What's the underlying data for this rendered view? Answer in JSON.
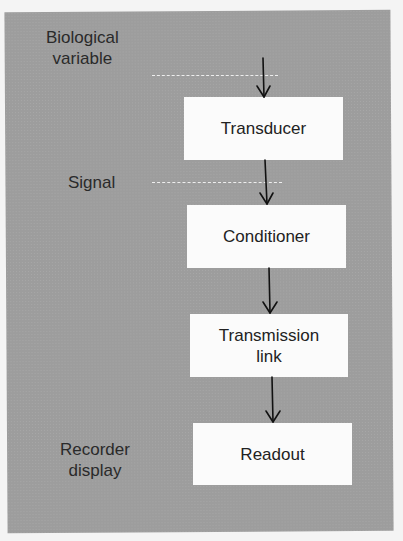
{
  "diagram": {
    "type": "block flow diagram",
    "side_labels": [
      {
        "id": "biological-variable",
        "line1": "Biological",
        "line2": "variable"
      },
      {
        "id": "signal",
        "line1": "Signal"
      },
      {
        "id": "recorder-display",
        "line1": "Recorder",
        "line2": "display"
      }
    ],
    "blocks": [
      {
        "id": "transducer",
        "line1": "Transducer"
      },
      {
        "id": "conditioner",
        "line1": "Conditioner"
      },
      {
        "id": "transmission-link",
        "line1": "Transmission",
        "line2": "link"
      },
      {
        "id": "readout",
        "line1": "Readout"
      }
    ],
    "flow": [
      "Biological variable",
      "Transducer",
      "Conditioner",
      "Transmission link",
      "Readout"
    ],
    "colors": {
      "panel": "#9d9d9d",
      "box": "#fbfbfb",
      "text": "#222222",
      "arrow": "#111111"
    }
  }
}
